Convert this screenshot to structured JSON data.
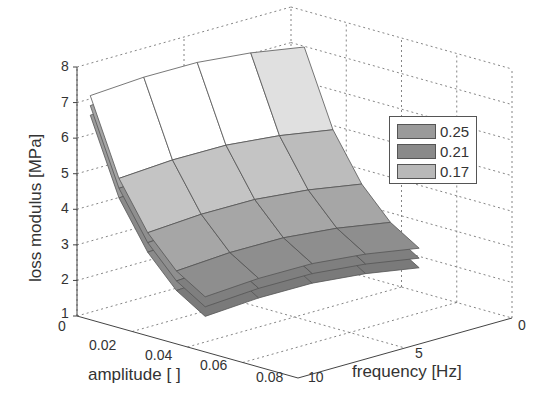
{
  "chart_data": {
    "type": "surface3d",
    "title": "",
    "xlabel": "amplitude [ ]",
    "ylabel": "frequency [Hz]",
    "zlabel": "loss modulus [MPa]",
    "x_ticks": [
      "0",
      "0.02",
      "0.04",
      "0.06",
      "0.08"
    ],
    "y_ticks": [
      "0",
      "5",
      "10"
    ],
    "z_ticks": [
      "1",
      "2",
      "3",
      "4",
      "5",
      "6",
      "7",
      "8"
    ],
    "xlim": [
      0,
      0.08
    ],
    "ylim": [
      0,
      10
    ],
    "zlim": [
      1,
      8
    ],
    "grid": true,
    "legend_position": "upper right inside",
    "legend": [
      "0.25",
      "0.21",
      "0.17"
    ],
    "series": [
      {
        "name": "0.25",
        "color": "#9a9a9a",
        "amplitude": [
          0.01,
          0.02,
          0.03,
          0.04,
          0.05
        ],
        "frequency": [
          1,
          3.25,
          5.5,
          7.75,
          10
        ],
        "loss_modulus_at_freq_1": [
          7.3,
          5.2,
          3.9,
          3.1,
          2.6
        ],
        "loss_modulus_at_freq_10": [
          7.6,
          5.6,
          4.3,
          3.4,
          2.8
        ]
      },
      {
        "name": "0.21",
        "color": "#8c8c8c",
        "loss_modulus_at_freq_1": [
          7.1,
          5.0,
          3.7,
          2.9,
          2.4
        ],
        "loss_modulus_at_freq_10": [
          7.4,
          5.4,
          4.1,
          3.2,
          2.6
        ]
      },
      {
        "name": "0.17",
        "color": "#b4b4b4",
        "loss_modulus_at_freq_1": [
          6.7,
          4.7,
          3.5,
          2.7,
          2.2
        ],
        "loss_modulus_at_freq_10": [
          7.0,
          5.1,
          3.8,
          3.0,
          2.4
        ]
      }
    ]
  },
  "legend_items": [
    {
      "label": "0.25",
      "color": "#9a9a9a"
    },
    {
      "label": "0.21",
      "color": "#8a8a8a"
    },
    {
      "label": "0.17",
      "color": "#b8b8b8"
    }
  ]
}
